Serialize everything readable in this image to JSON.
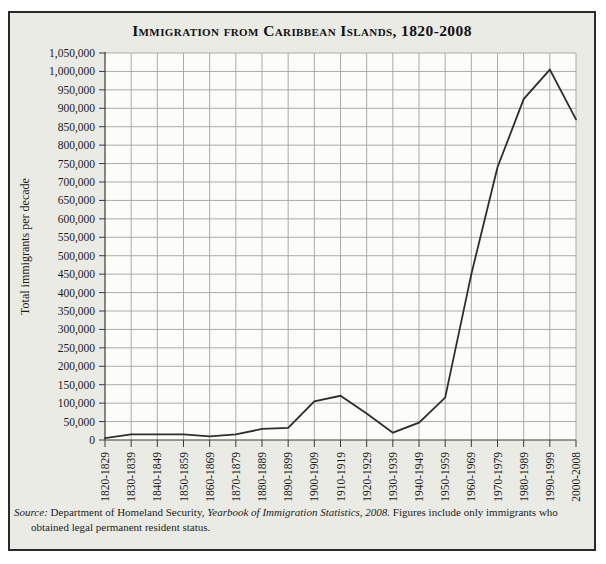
{
  "figure": {
    "title": "Immigration from Caribbean Islands, 1820-2008",
    "edge_artifact": "g",
    "source_note": {
      "prefix": "Source:",
      "segment1": " Department of Homeland Security, ",
      "italic_title": "Yearbook of Immigration Statistics, 2008.",
      "segment2": " Figures include only immigrants who obtained legal permanent resident status."
    }
  },
  "chart_data": {
    "type": "line",
    "title": "Immigration from Caribbean Islands, 1820-2008",
    "xlabel": "",
    "ylabel": "Total immigrants per decade",
    "categories": [
      "1820-1829",
      "1830-1839",
      "1840-1849",
      "1850-1859",
      "1860-1869",
      "1870-1879",
      "1880-1889",
      "1890-1899",
      "1900-1909",
      "1910-1919",
      "1920-1929",
      "1930-1939",
      "1940-1949",
      "1950-1959",
      "1960-1969",
      "1970-1979",
      "1980-1989",
      "1990-1999",
      "2000-2008"
    ],
    "values": [
      5000,
      15000,
      15000,
      15000,
      10000,
      15000,
      30000,
      33000,
      105000,
      120000,
      72000,
      20000,
      47000,
      115000,
      450000,
      740000,
      925000,
      1005000,
      870000
    ],
    "ylim": [
      0,
      1050000
    ],
    "ytick_step": 50000,
    "ytick_labels": [
      "0",
      "50,000",
      "100,000",
      "150,000",
      "200,000",
      "250,000",
      "300,000",
      "350,000",
      "400,000",
      "450,000",
      "500,000",
      "550,000",
      "600,000",
      "650,000",
      "700,000",
      "750,000",
      "800,000",
      "850,000",
      "900,000",
      "950,000",
      "1,000,000",
      "1,050,000"
    ],
    "grid": true,
    "legend": false,
    "line_color": "#2e2e2e",
    "grid_color": "#ababab",
    "axis_color": "#3a3a3a",
    "background": "#ebebe5",
    "plot_background": "#fcfcf9"
  }
}
